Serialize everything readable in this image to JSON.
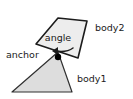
{
  "diagram": {
    "background_color": "#ffffff",
    "labels": {
      "angle": "angle",
      "anchor": "anchor",
      "body1": "body1",
      "body2": "body2"
    },
    "shapes": {
      "body1": {
        "name": "body1",
        "kind": "triangle",
        "fill": "#dddddd",
        "stroke": "#303030",
        "points": "12,92 72,92 58,52"
      },
      "body2": {
        "name": "body2",
        "kind": "quadrilateral",
        "fill": "#ededed",
        "stroke": "#1c1c1c",
        "points": "36,44 58,18 87,21 78,58"
      },
      "anchor_point": {
        "name": "anchor-point",
        "kind": "dot",
        "fill": "#000000",
        "cx": 58,
        "cy": 57,
        "r": 3.2
      },
      "angle_arrow": {
        "name": "angle-arrow",
        "kind": "curved-arrow",
        "stroke": "#1c1c1c",
        "path": "M 73 48 C 68 52 62 52 55 51",
        "arrowhead": "52,51 58,47 58,55"
      }
    },
    "label_positions": {
      "angle": {
        "x": 58,
        "y": 38
      },
      "anchor": {
        "x": 6,
        "y": 55
      },
      "body1": {
        "x": 77,
        "y": 79
      },
      "body2": {
        "x": 95,
        "y": 28
      }
    }
  }
}
